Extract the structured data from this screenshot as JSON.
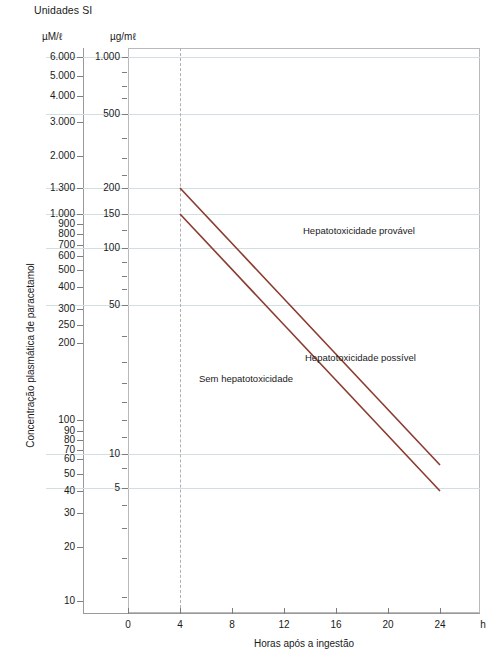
{
  "title": "Unidades SI",
  "units": {
    "left_axis": "µM/ℓ",
    "right_axis": "µg/mℓ"
  },
  "axes": {
    "y_title": "Concentração plasmática de paracetamol",
    "x_title": "Horas após a ingestão",
    "x_unit": "h"
  },
  "colors": {
    "line": "#8B3A2E",
    "gridline": "#cfdfe2",
    "frame": "#b9b9b9",
    "marker": "#b0b0b0",
    "text": "#1a1a1a"
  },
  "chart_data": {
    "type": "line",
    "title": "Unidades SI",
    "xlabel": "Horas após a ingestão",
    "ylabel": "Concentração plasmática de paracetamol",
    "xlim": [
      -1.8,
      25.8
    ],
    "ylim_ugml": [
      2.6,
      1000
    ],
    "yscale": "log",
    "grid": true,
    "legend": "none",
    "x_ticks": [
      0,
      4,
      8,
      12,
      16,
      20,
      24
    ],
    "x_tick_labels": [
      "0",
      "4",
      "8",
      "12",
      "16",
      "20",
      "24"
    ],
    "y_ticks_ugml": [
      1000,
      500,
      200,
      150,
      100,
      50,
      10,
      5
    ],
    "y_tick_labels_ugml": [
      "1.000",
      "500",
      "200",
      "150",
      "100",
      "50",
      "10",
      "5"
    ],
    "y_ticks_um": [
      6000,
      5000,
      4000,
      3000,
      2000,
      1300,
      1000,
      900,
      800,
      700,
      600,
      500,
      400,
      300,
      250,
      200,
      100,
      90,
      80,
      70,
      60,
      50,
      40,
      30,
      20,
      10
    ],
    "y_tick_labels_um": [
      "6.000",
      "5.000",
      "4.000",
      "3.000",
      "2.000",
      "1.300",
      "1.000",
      "900",
      "800",
      "700",
      "600",
      "500",
      "400",
      "300",
      "250",
      "200",
      "100",
      "90",
      "80",
      "70",
      "60",
      "50",
      "40",
      "30",
      "20",
      "10"
    ],
    "gridline_values_ugml": [
      1000,
      500,
      200,
      150,
      100,
      50,
      10,
      5
    ],
    "marker_line": {
      "x": 4,
      "style": "dashed",
      "label": "4 h"
    },
    "series": [
      {
        "name": "Linha de hepatotoxicidade provável",
        "x": [
          4,
          24
        ],
        "y_ugml": [
          200,
          30
        ],
        "y_um": [
          1300,
          200
        ],
        "color": "#8B3A2E"
      },
      {
        "name": "Linha de hepatotoxicidade possível",
        "x": [
          4,
          24
        ],
        "y_ugml": [
          150,
          22.5
        ],
        "y_um": [
          1000,
          150
        ],
        "color": "#8B3A2E"
      }
    ],
    "annotations": [
      {
        "text": "Hepatotoxicidade provável",
        "x": 12.4,
        "y_ugml": 330
      },
      {
        "text": "Hepatotoxicidade possível",
        "x": 12.5,
        "y_ugml": 42
      },
      {
        "text": "Sem hepatotoxicidade",
        "x": 5.6,
        "y_ugml": 33
      }
    ]
  },
  "y_axis_um": [
    {
      "label": "6.000",
      "top": 57
    },
    {
      "label": "5.000",
      "top": 76
    },
    {
      "label": "4.000",
      "top": 96
    },
    {
      "label": "3.000",
      "top": 122
    },
    {
      "label": "2.000",
      "top": 156
    },
    {
      "label": "1.300",
      "top": 188
    },
    {
      "label": "1.000",
      "top": 214
    },
    {
      "label": "900",
      "top": 224
    },
    {
      "label": "800",
      "top": 234
    },
    {
      "label": "700",
      "top": 245
    },
    {
      "label": "600",
      "top": 256
    },
    {
      "label": "500",
      "top": 270
    },
    {
      "label": "400",
      "top": 287
    },
    {
      "label": "300",
      "top": 309
    },
    {
      "label": "250",
      "top": 325
    },
    {
      "label": "200",
      "top": 343
    },
    {
      "label": "100",
      "top": 420
    },
    {
      "label": "90",
      "top": 431
    },
    {
      "label": "80",
      "top": 440
    },
    {
      "label": "70",
      "top": 450
    },
    {
      "label": "60",
      "top": 459
    },
    {
      "label": "50",
      "top": 474
    },
    {
      "label": "40",
      "top": 491
    },
    {
      "label": "30",
      "top": 513
    },
    {
      "label": "20",
      "top": 547
    },
    {
      "label": "10",
      "top": 601
    }
  ],
  "y_axis_ugml": [
    {
      "label": "1.000",
      "top": 57
    },
    {
      "label": "500",
      "top": 114
    },
    {
      "label": "200",
      "top": 188
    },
    {
      "label": "150",
      "top": 214
    },
    {
      "label": "100",
      "top": 248
    },
    {
      "label": "50",
      "top": 305
    },
    {
      "label": "10",
      "top": 454
    },
    {
      "label": "5",
      "top": 488
    }
  ],
  "x_axis": [
    {
      "label": "0",
      "left": 128
    },
    {
      "label": "4",
      "left": 180
    },
    {
      "label": "8",
      "left": 232
    },
    {
      "label": "12",
      "left": 284
    },
    {
      "label": "16",
      "left": 336
    },
    {
      "label": "20",
      "left": 388
    },
    {
      "label": "24",
      "left": 440
    }
  ],
  "gridlines": [
    57,
    114,
    188,
    214,
    248,
    305,
    454,
    488
  ],
  "minor_ticks_ugml": [
    72,
    86,
    98,
    138,
    158,
    175,
    230,
    262,
    276,
    289,
    336,
    362,
    383,
    402,
    420,
    437,
    468,
    505,
    528,
    558,
    597
  ],
  "zone_labels": [
    "Hepatotoxicidade provável",
    "Hepatotoxicidade possível",
    "Sem hepatotoxicidade"
  ]
}
